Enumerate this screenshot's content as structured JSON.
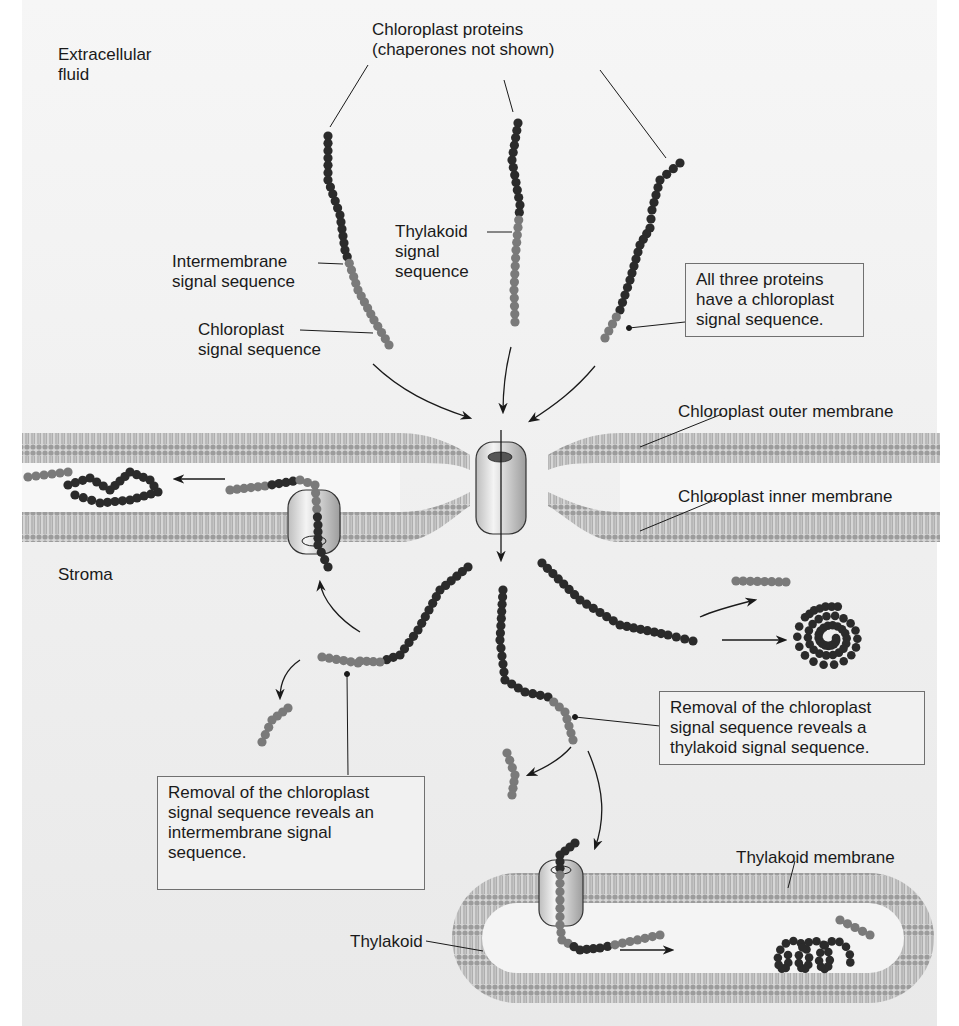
{
  "colors": {
    "background": "#efefef",
    "membrane": "#a9a9a9",
    "membrane_head": "#9a9a9a",
    "protein_mature": "#2b2b2b",
    "signal_sequence": "#7a7a7a",
    "translocon": "#d9d9d9",
    "text": "#1a1a1a"
  },
  "labels": {
    "extracellular": [
      "Extracellular",
      "fluid"
    ],
    "chloroplast_proteins": [
      "Chloroplast proteins",
      "(chaperones not shown)"
    ],
    "thylakoid_signal": [
      "Thylakoid",
      "signal",
      "sequence"
    ],
    "intermembrane_signal": [
      "Intermembrane",
      "signal sequence"
    ],
    "chloroplast_signal": [
      "Chloroplast",
      "signal sequence"
    ],
    "outer_membrane": "Chloroplast outer membrane",
    "inner_membrane": "Chloroplast inner membrane",
    "stroma": "Stroma",
    "thylakoid_membrane": "Thylakoid membrane",
    "thylakoid": "Thylakoid"
  },
  "callouts": {
    "all_three": [
      "All three proteins",
      "have a chloroplast",
      "signal sequence."
    ],
    "intermembrane_reveal": [
      "Removal of the chloroplast",
      "signal sequence reveals an",
      "intermembrane signal",
      "sequence."
    ],
    "thylakoid_reveal": [
      "Removal of the chloroplast",
      "signal sequence reveals a",
      "thylakoid signal sequence."
    ]
  }
}
